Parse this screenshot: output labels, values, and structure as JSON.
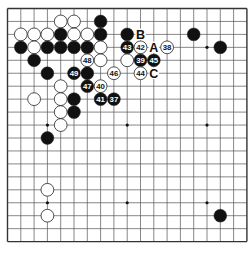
{
  "board": {
    "size": 19,
    "origin": {
      "x": 7.5,
      "y": 8.5
    },
    "spacing": {
      "x": 13.3,
      "y": 12.95
    },
    "colors": {
      "line": "#555555",
      "border": "#333333",
      "black": "#111111",
      "white": "#ffffff",
      "stone_edge": "#222222"
    },
    "star_points": [
      [
        3,
        3
      ],
      [
        9,
        3
      ],
      [
        15,
        3
      ],
      [
        3,
        9
      ],
      [
        9,
        9
      ],
      [
        15,
        9
      ],
      [
        3,
        15
      ],
      [
        9,
        15
      ],
      [
        15,
        15
      ]
    ],
    "stones": [
      {
        "col": 4,
        "row": 1,
        "color": "white",
        "label": ""
      },
      {
        "col": 5,
        "row": 1,
        "color": "white",
        "label": ""
      },
      {
        "col": 7,
        "row": 1,
        "color": "black",
        "label": ""
      },
      {
        "col": 1,
        "row": 2,
        "color": "white",
        "label": ""
      },
      {
        "col": 2,
        "row": 2,
        "color": "white",
        "label": ""
      },
      {
        "col": 3,
        "row": 2,
        "color": "white",
        "label": ""
      },
      {
        "col": 4,
        "row": 2,
        "color": "black",
        "label": ""
      },
      {
        "col": 5,
        "row": 2,
        "color": "white",
        "label": ""
      },
      {
        "col": 6,
        "row": 2,
        "color": "white",
        "label": ""
      },
      {
        "col": 7,
        "row": 2,
        "color": "black",
        "label": ""
      },
      {
        "col": 9,
        "row": 2,
        "color": "black",
        "label": ""
      },
      {
        "col": 14,
        "row": 2,
        "color": "black",
        "label": ""
      },
      {
        "col": 1,
        "row": 3,
        "color": "black",
        "label": ""
      },
      {
        "col": 2,
        "row": 3,
        "color": "white",
        "label": ""
      },
      {
        "col": 3,
        "row": 3,
        "color": "black",
        "label": ""
      },
      {
        "col": 4,
        "row": 3,
        "color": "black",
        "label": ""
      },
      {
        "col": 5,
        "row": 3,
        "color": "black",
        "label": ""
      },
      {
        "col": 6,
        "row": 3,
        "color": "black",
        "label": ""
      },
      {
        "col": 7,
        "row": 3,
        "color": "white",
        "label": ""
      },
      {
        "col": 9,
        "row": 3,
        "color": "black",
        "label": "43"
      },
      {
        "col": 10,
        "row": 3,
        "color": "white",
        "label": "42"
      },
      {
        "col": 12,
        "row": 3,
        "color": "white",
        "label": "38"
      },
      {
        "col": 16,
        "row": 3,
        "color": "black",
        "label": ""
      },
      {
        "col": 2,
        "row": 4,
        "color": "black",
        "label": ""
      },
      {
        "col": 6,
        "row": 4,
        "color": "white",
        "label": "48"
      },
      {
        "col": 7,
        "row": 4,
        "color": "white",
        "label": ""
      },
      {
        "col": 9,
        "row": 4,
        "color": "white",
        "label": ""
      },
      {
        "col": 10,
        "row": 4,
        "color": "black",
        "label": "39"
      },
      {
        "col": 11,
        "row": 4,
        "color": "black",
        "label": "45"
      },
      {
        "col": 3,
        "row": 5,
        "color": "black",
        "label": ""
      },
      {
        "col": 5,
        "row": 5,
        "color": "black",
        "label": "49"
      },
      {
        "col": 6,
        "row": 5,
        "color": "black",
        "label": ""
      },
      {
        "col": 8,
        "row": 5,
        "color": "white",
        "label": "46"
      },
      {
        "col": 10,
        "row": 5,
        "color": "white",
        "label": "44"
      },
      {
        "col": 4,
        "row": 6,
        "color": "white",
        "label": ""
      },
      {
        "col": 6,
        "row": 6,
        "color": "black",
        "label": "47"
      },
      {
        "col": 7,
        "row": 6,
        "color": "white",
        "label": "40"
      },
      {
        "col": 2,
        "row": 7,
        "color": "white",
        "label": ""
      },
      {
        "col": 4,
        "row": 7,
        "color": "white",
        "label": ""
      },
      {
        "col": 5,
        "row": 7,
        "color": "black",
        "label": ""
      },
      {
        "col": 7,
        "row": 7,
        "color": "black",
        "label": "41"
      },
      {
        "col": 8,
        "row": 7,
        "color": "black",
        "label": "37"
      },
      {
        "col": 4,
        "row": 8,
        "color": "white",
        "label": ""
      },
      {
        "col": 5,
        "row": 8,
        "color": "black",
        "label": ""
      },
      {
        "col": 4,
        "row": 9,
        "color": "white",
        "label": ""
      },
      {
        "col": 3,
        "row": 10,
        "color": "black",
        "label": ""
      },
      {
        "col": 3,
        "row": 14,
        "color": "white",
        "label": ""
      },
      {
        "col": 3,
        "row": 16,
        "color": "white",
        "label": ""
      },
      {
        "col": 16,
        "row": 16,
        "color": "black",
        "label": ""
      }
    ],
    "marks": [
      {
        "col": 10,
        "row": 2,
        "label": "B"
      },
      {
        "col": 11,
        "row": 3,
        "label": "A"
      },
      {
        "col": 11,
        "row": 5,
        "label": "C"
      }
    ]
  }
}
